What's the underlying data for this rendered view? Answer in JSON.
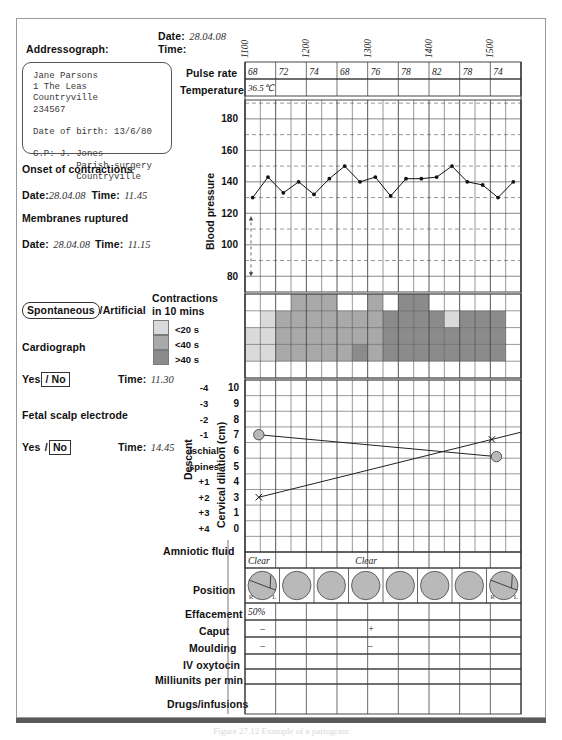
{
  "document": {
    "title": "Partogram",
    "caption": "Figure 27.12  Example of a partogram"
  },
  "patient_panel": {
    "addressograph_label": "Addressograph:",
    "addressograph_lines": [
      "Jane Parsons",
      "1 The Leas",
      "Countryville",
      "234567",
      "",
      "Date of birth: 13/6/80",
      "",
      "G.P: J. Jones",
      "        Parish surgery",
      "        Countryville"
    ],
    "onset_label": "Onset of contractions",
    "onset_date_label": "Date:",
    "onset_date_value": "28.04.08",
    "onset_time_label": "Time:",
    "onset_time_value": "11.45",
    "membranes_label": "Membranes ruptured",
    "membranes_date_label": "Date:",
    "membranes_date_value": "28.04.08",
    "membranes_time_label": "Time:",
    "membranes_time_value": "11.15",
    "rupture_type_option_a": "Spontaneous",
    "rupture_type_separator": "/",
    "rupture_type_option_b": "Artificial",
    "cardiograph_label": "Cardiograph",
    "cardiograph_yes": "Yes",
    "cardiograph_sep": "/",
    "cardiograph_no": "No",
    "cardiograph_time_label": "Time:",
    "cardiograph_time_value": "11.30",
    "fse_label": "Fetal scalp electrode",
    "fse_yes": "Yes",
    "fse_sep": "/",
    "fse_no": "No",
    "fse_time_label": "Time:",
    "fse_time_value": "14.45"
  },
  "header": {
    "date_label": "Date:",
    "date_value": "28.04.08",
    "time_label": "Time:"
  },
  "legend": {
    "title_line1": "Contractions",
    "title_line2": "in 10 mins",
    "items": [
      {
        "label": "<20 s",
        "color": "#dadada"
      },
      {
        "label": "<40 s",
        "color": "#a9a9a9"
      },
      {
        "label": ">40 s",
        "color": "#8b8b8b"
      }
    ]
  },
  "row_labels": {
    "pulse_rate": "Pulse rate",
    "temperature": "Temperature",
    "blood_pressure": "Blood pressure",
    "descent": "Descent",
    "cervical_dilation": "Cervical dilation (cm)",
    "amniotic_fluid": "Amniotic fluid",
    "position": "Position",
    "effacement": "Effacement",
    "caput": "Caput",
    "moulding": "Moulding",
    "iv_oxytocin": "IV oxytocin",
    "milliunits": "Milliunits per min",
    "drugs": "Drugs/infusions"
  },
  "chart_data": {
    "type": "line",
    "title": "Partogram",
    "time_ticks": [
      "1100",
      "1200",
      "1300",
      "1400",
      "1500"
    ],
    "columns": 18,
    "pulse_rate": {
      "label": "Pulse rate",
      "values": [
        "68",
        "72",
        "74",
        "68",
        "76",
        "78",
        "82",
        "78",
        "74"
      ]
    },
    "temperature": {
      "label": "Temperature",
      "values": [
        "36.5℃"
      ]
    },
    "blood_pressure": {
      "label": "Blood pressure",
      "ylabel": "Blood pressure",
      "yticks": [
        80,
        100,
        120,
        140,
        160,
        180
      ],
      "ylim": [
        70,
        190
      ],
      "systolic": [
        130,
        143,
        133,
        140,
        132,
        142,
        150,
        140,
        143,
        131,
        142,
        142,
        143,
        150,
        140,
        138,
        130,
        140
      ],
      "arrow": {
        "column": 0,
        "top": 118,
        "bottom": 80
      }
    },
    "contractions": {
      "label": "Contractions in 10 mins",
      "rows": 5,
      "grid_top_to_bottom": [
        [
          "",
          "",
          "",
          "m",
          "m",
          "m",
          "",
          "",
          "m",
          "",
          "d",
          "d",
          "",
          "",
          "",
          "",
          "",
          ""
        ],
        [
          "",
          "l",
          "m",
          "m",
          "m",
          "m",
          "m",
          "m",
          "m",
          "d",
          "d",
          "d",
          "d",
          "l",
          "d",
          "d",
          "d",
          ""
        ],
        [
          "l",
          "l",
          "m",
          "m",
          "m",
          "m",
          "m",
          "m",
          "m",
          "d",
          "d",
          "d",
          "d",
          "d",
          "d",
          "d",
          "d",
          ""
        ],
        [
          "l",
          "l",
          "m",
          "m",
          "m",
          "m",
          "m",
          "d",
          "m",
          "d",
          "d",
          "d",
          "d",
          "d",
          "d",
          "d",
          "d",
          ""
        ],
        [
          "",
          "",
          "",
          "",
          "",
          "",
          "",
          "",
          "",
          "",
          "",
          "",
          "",
          "",
          "",
          "",
          "",
          ""
        ]
      ]
    },
    "cervical_dilation": {
      "ylabel": "Cervical dilation (cm)",
      "yticks": [
        "10",
        "9",
        "8",
        "7",
        "6",
        "5",
        "4",
        "3",
        "1",
        "0"
      ],
      "dilation_marker": "X",
      "dilation_points": [
        {
          "column": 0.4,
          "value": 3
        },
        {
          "column": 15.6,
          "value": 6.7
        }
      ],
      "descent_marker": "circle",
      "descent_points": [
        {
          "column": 0.4,
          "value": 7
        },
        {
          "column": 15.9,
          "value": 5.6
        }
      ]
    },
    "descent_axis": {
      "labels": [
        "-4",
        "-3",
        "-2",
        "-1",
        "Ischial",
        "spines",
        "+1",
        "+2",
        "+3",
        "+4"
      ]
    },
    "amniotic_fluid": {
      "values": [
        {
          "column": 0,
          "text": "Clear"
        },
        {
          "column": 7,
          "text": "Clear"
        }
      ]
    },
    "position": {
      "circles": 8,
      "marked_columns": [
        0,
        7
      ],
      "side_labels": [
        "R",
        "L"
      ]
    },
    "effacement": {
      "values": [
        {
          "column": 0,
          "text": "50%"
        }
      ]
    },
    "caput": {
      "values": [
        {
          "column": 0,
          "text": "–"
        },
        {
          "column": 7,
          "text": "+"
        }
      ]
    },
    "moulding": {
      "values": [
        {
          "column": 0,
          "text": "–"
        },
        {
          "column": 7,
          "text": "–"
        }
      ]
    },
    "iv_oxytocin": {
      "values": []
    },
    "milliunits": {
      "values": []
    },
    "drugs": {
      "values": []
    }
  }
}
